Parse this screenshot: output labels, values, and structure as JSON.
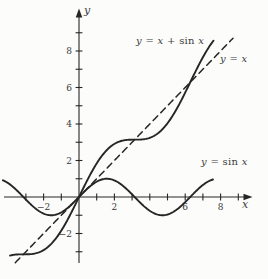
{
  "figure": {
    "background": "#fcfcfb",
    "ink": "#262626",
    "text_color": "#3d3d3d"
  },
  "chart_data": {
    "type": "line",
    "title": "",
    "xlabel": "x",
    "ylabel": "y",
    "grid": false,
    "legend_position": "inline curve annotations",
    "x_axis": {
      "ticks": [
        -3,
        -2,
        -1,
        1,
        2,
        3,
        4,
        5,
        6,
        7,
        8,
        9
      ],
      "labeled_ticks": [
        {
          "value": -2,
          "text": "−2"
        },
        {
          "value": 2,
          "text": "2"
        },
        {
          "value": 6,
          "text": "6"
        },
        {
          "value": 8,
          "text": "8"
        }
      ],
      "range_shown": [
        -4.3,
        9.8
      ]
    },
    "y_axis": {
      "ticks": [
        -3,
        -2,
        -1,
        1,
        2,
        3,
        4,
        5,
        6,
        7,
        8,
        9
      ],
      "labeled_ticks": [
        {
          "value": -2,
          "text": "−2"
        },
        {
          "value": 2,
          "text": "2"
        },
        {
          "value": 4,
          "text": "4"
        },
        {
          "value": 6,
          "text": "6"
        },
        {
          "value": 8,
          "text": "8"
        }
      ],
      "range_shown": [
        -3.6,
        10.3
      ]
    },
    "series": [
      {
        "name": "y = x + sin x",
        "fn": "x_plus_sin_x",
        "expression": "y = x + sin(x)",
        "style": "solid",
        "domain": [
          -3.9,
          7.6
        ]
      },
      {
        "name": "y = x",
        "fn": "identity",
        "expression": "y = x",
        "style": "dashed",
        "domain": [
          -3.6,
          8.7
        ]
      },
      {
        "name": "y = sin x",
        "fn": "sin",
        "expression": "y = sin(x)",
        "style": "solid",
        "domain": [
          -4.3,
          7.57
        ]
      }
    ],
    "key_points": [
      {
        "x": 0,
        "y": 0,
        "note": "all three curves pass through the origin"
      },
      {
        "x": 3.14159,
        "y": 3.14159,
        "note": "y = x + sin x crosses y = x at x = pi"
      },
      {
        "x": 6.28319,
        "y": 6.28319,
        "note": "y = x + sin x crosses y = x at x = 2pi"
      }
    ]
  },
  "annotations": {
    "sum_label": {
      "pre": "y = x + ",
      "fn": "sin",
      "post": " x"
    },
    "identity_label": {
      "text": "y = x"
    },
    "sin_label": {
      "pre": "y = ",
      "fn": "sin",
      "post": " x"
    },
    "x_var": "x",
    "y_var": "y"
  }
}
